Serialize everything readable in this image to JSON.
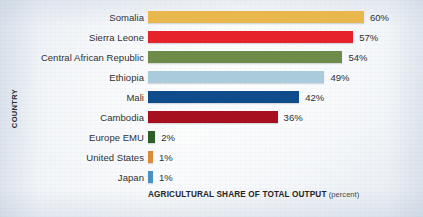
{
  "chart_data": {
    "type": "bar",
    "orientation": "horizontal",
    "title": "",
    "xlabel": "AGRICULTURAL SHARE OF TOTAL OUTPUT",
    "xlabel_unit": "(percent)",
    "ylabel": "COUNTRY",
    "xlim": [
      0,
      60
    ],
    "grid": false,
    "legend": "none",
    "value_suffix": "%",
    "categories": [
      "Somalia",
      "Sierra Leone",
      "Central African Republic",
      "Ethiopia",
      "Mali",
      "Cambodia",
      "Europe EMU",
      "United States",
      "Japan"
    ],
    "values": [
      60,
      57,
      54,
      49,
      42,
      36,
      2,
      1,
      1
    ],
    "value_labels": [
      "60%",
      "57%",
      "54%",
      "49%",
      "42%",
      "36%",
      "2%",
      "1%",
      "1%"
    ],
    "bar_colors": [
      "#e8b84f",
      "#e6232b",
      "#6d8c49",
      "#a9cbdc",
      "#0f4c8c",
      "#a6101f",
      "#2d5e28",
      "#d98b3a",
      "#4a90c2"
    ],
    "bars": [
      {
        "category": "Somalia",
        "value": 60,
        "label": "60%",
        "color": "#e8b84f"
      },
      {
        "category": "Sierra Leone",
        "value": 57,
        "label": "57%",
        "color": "#e6232b"
      },
      {
        "category": "Central African Republic",
        "value": 54,
        "label": "54%",
        "color": "#6d8c49"
      },
      {
        "category": "Ethiopia",
        "value": 49,
        "label": "49%",
        "color": "#a9cbdc"
      },
      {
        "category": "Mali",
        "value": 42,
        "label": "42%",
        "color": "#0f4c8c"
      },
      {
        "category": "Cambodia",
        "value": 36,
        "label": "36%",
        "color": "#a6101f"
      },
      {
        "category": "Europe EMU",
        "value": 2,
        "label": "2%",
        "color": "#2d5e28"
      },
      {
        "category": "United States",
        "value": 1,
        "label": "1%",
        "color": "#d98b3a"
      },
      {
        "category": "Japan",
        "value": 1,
        "label": "1%",
        "color": "#4a90c2"
      }
    ]
  },
  "style": {
    "background": "#eef2f6",
    "text_color": "#303030",
    "bar_start_px": 148,
    "px_per_percent": 3.6,
    "min_bar_px": 5
  }
}
